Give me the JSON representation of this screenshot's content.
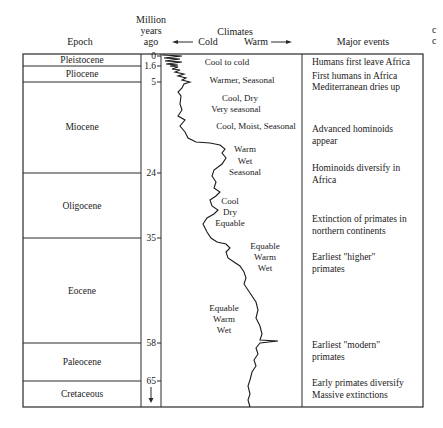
{
  "headers": {
    "epoch": "Epoch",
    "mya_line1": "Million",
    "mya_line2": "years",
    "mya_line3": "ago",
    "climates": "Climates",
    "cold": "Cold",
    "warm": "Warm",
    "major_events": "Major events"
  },
  "epochs": [
    {
      "name": "Pleistocene"
    },
    {
      "name": "Pliocene"
    },
    {
      "name": "Miocene"
    },
    {
      "name": "Oligocene"
    },
    {
      "name": "Eocene"
    },
    {
      "name": "Paleocene"
    },
    {
      "name": "Cretaceous"
    }
  ],
  "ticks": [
    "0",
    "1.6",
    "5",
    "24",
    "35",
    "58",
    "65"
  ],
  "climates": [
    {
      "l1": "Cool to cold"
    },
    {
      "l1": "Warmer, Seasonal"
    },
    {
      "l1": "Cool, Dry",
      "l2": "Very seasonal"
    },
    {
      "l1": "Cool, Moist, Seasonal"
    },
    {
      "l1": "Warm",
      "l2": "Wet",
      "l3": "Seasonal"
    },
    {
      "l1": "Cool",
      "l2": "Dry",
      "l3": "Equable"
    },
    {
      "l1": "Equable",
      "l2": "Warm",
      "l3": "Wet"
    },
    {
      "l1": "Equable",
      "l2": "Warm",
      "l3": "Wet"
    }
  ],
  "events": [
    {
      "l1": "Humans first leave Africa"
    },
    {
      "l1": "First humans in Africa",
      "l2": "Mediterranean dries up"
    },
    {
      "l1": "Advanced hominoids",
      "l2": "appear"
    },
    {
      "l1": "Hominoids diversify in",
      "l2": "Africa"
    },
    {
      "l1": "Extinction of primates in",
      "l2": "northern continents"
    },
    {
      "l1": "Earliest \"higher\"",
      "l2": "primates"
    },
    {
      "l1": "Earliest \"modern\"",
      "l2": "primates"
    },
    {
      "l1": "Early primates diversify",
      "l2": "Massive extinctions"
    }
  ],
  "edge_glyphs": [
    "c",
    "c"
  ],
  "colors": {
    "line": "#2a2a2a",
    "text": "#1a1a1a",
    "background": "#ffffff"
  }
}
